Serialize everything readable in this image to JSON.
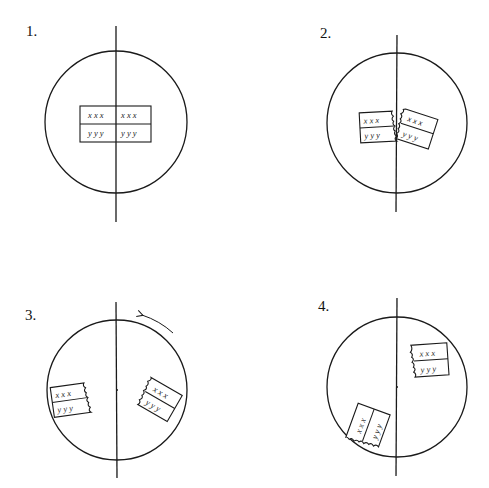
{
  "figure": {
    "panels": [
      {
        "label": "1.",
        "description": "Intact chromosome pair straddling spindle axis",
        "rows": {
          "top": [
            "x x x",
            "x x x"
          ],
          "bottom": [
            "y y y",
            "y y y"
          ]
        }
      },
      {
        "label": "2.",
        "description": "Chromosome pieces separating at jagged break along axis",
        "rows": {
          "top": [
            "x x x",
            "x x x"
          ],
          "bottom": [
            "y y y",
            "y y y"
          ]
        }
      },
      {
        "label": "3.",
        "description": "Fragments moved apart; circle rotating counter-clockwise",
        "rows": {
          "top": [
            "x x x",
            "x x x"
          ],
          "bottom": [
            "y y y",
            "y y y"
          ]
        },
        "arrow": "counter-clockwise rotation arrow"
      },
      {
        "label": "4.",
        "description": "Fragments repositioned after rotation",
        "rows": {
          "top": [
            "x x x",
            "x x x"
          ],
          "bottom": [
            "y y y",
            "y y y"
          ]
        }
      }
    ],
    "colors": {
      "ink": "#1a1a1a",
      "background": "#ffffff"
    }
  }
}
